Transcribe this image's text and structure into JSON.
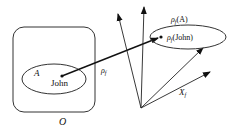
{
  "diagram": {
    "left_set": {
      "container_label": "O",
      "subset_label": "A",
      "element_label": "John"
    },
    "mapping": {
      "label_main": "ρ",
      "label_sub": "f"
    },
    "right_space": {
      "image_set_label_main": "ρ",
      "image_set_label_sub": "f",
      "image_set_label_arg": "(A)",
      "image_element_label_main": "ρ",
      "image_element_label_sub": "f",
      "image_element_label_arg": "(John)",
      "space_label_main": "X",
      "space_label_sub": "f"
    },
    "colors": {
      "stroke": "#222222",
      "background": "#ffffff"
    }
  }
}
